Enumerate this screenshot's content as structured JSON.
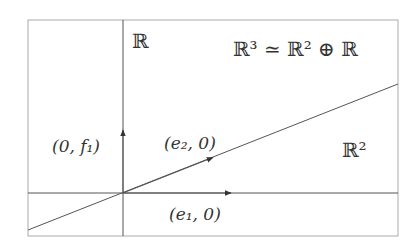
{
  "diagram": {
    "labels": {
      "vertical_axis": "ℝ",
      "decomposition": "ℝ³ ≃ ℝ² ⊕ ℝ",
      "plane": "ℝ²",
      "vertical_vector": "(0, f₁)",
      "slanted_vector": "(e₂, 0)",
      "horizontal_vector": "(e₁, 0)"
    },
    "colors": {
      "frame": "#aaaaaa",
      "lines": "#555555",
      "text": "#333333"
    }
  }
}
